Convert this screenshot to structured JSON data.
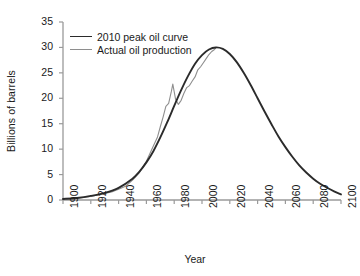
{
  "chart_data": {
    "type": "line",
    "title": "",
    "xlabel": "Year",
    "ylabel": "Billions of barrels",
    "xlim": [
      1900,
      2100
    ],
    "ylim": [
      0,
      35
    ],
    "grid": false,
    "legend_position": "upper-left-inside",
    "x_ticks": [
      1900,
      1920,
      1940,
      1960,
      1980,
      2000,
      2020,
      2040,
      2060,
      2080,
      2100
    ],
    "y_ticks": [
      0,
      5,
      10,
      15,
      20,
      25,
      30,
      35
    ],
    "series": [
      {
        "name": "2010 peak oil curve",
        "color": "#2b2b2b",
        "width": 1.9,
        "x": [
          1900,
          1910,
          1920,
          1930,
          1940,
          1950,
          1955,
          1960,
          1965,
          1970,
          1975,
          1980,
          1985,
          1990,
          1995,
          2000,
          2005,
          2010,
          2015,
          2020,
          2025,
          2030,
          2035,
          2040,
          2045,
          2050,
          2055,
          2060,
          2065,
          2070,
          2075,
          2080,
          2085,
          2090,
          2095,
          2100
        ],
        "values": [
          0.2,
          0.4,
          0.8,
          1.4,
          2.4,
          4.2,
          5.6,
          7.4,
          9.6,
          12.3,
          15.3,
          18.5,
          21.6,
          24.4,
          26.8,
          28.5,
          29.6,
          30.0,
          29.7,
          28.7,
          27.1,
          25.0,
          22.6,
          20.0,
          17.4,
          14.9,
          12.5,
          10.4,
          8.5,
          6.8,
          5.4,
          4.2,
          3.2,
          2.4,
          1.7,
          1.1
        ]
      },
      {
        "name": "Actual oil production",
        "color": "#8e8e8e",
        "width": 1.1,
        "x": [
          1900,
          1910,
          1920,
          1930,
          1935,
          1940,
          1945,
          1950,
          1955,
          1960,
          1965,
          1968,
          1970,
          1972,
          1974,
          1976,
          1978,
          1979,
          1981,
          1983,
          1985,
          1987,
          1989,
          1991,
          1993,
          1995,
          1997,
          1999,
          2001,
          2003,
          2005,
          2007,
          2009,
          2010
        ],
        "values": [
          0.15,
          0.35,
          0.7,
          1.3,
          1.6,
          2.1,
          2.7,
          3.9,
          5.4,
          7.6,
          10.6,
          12.4,
          14.4,
          16.3,
          18.4,
          19.0,
          21.4,
          22.8,
          19.8,
          18.8,
          19.6,
          21.0,
          22.1,
          22.5,
          23.4,
          24.2,
          25.6,
          26.2,
          27.0,
          27.8,
          28.6,
          29.2,
          29.6,
          29.9
        ]
      }
    ],
    "axis_color": "#9a9a9a",
    "text_color": "#1a1a1a"
  },
  "axes": {
    "ylabel": "Billions of barrels",
    "xlabel": "Year"
  },
  "legend": {
    "items": [
      {
        "label": "2010 peak oil curve"
      },
      {
        "label": "Actual oil production"
      }
    ]
  }
}
